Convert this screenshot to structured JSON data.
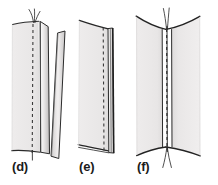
{
  "figure": {
    "type": "line-drawing",
    "background_color": "#ffffff",
    "fabric_fill": "#eceaea",
    "fabric_shade": "#d6d4d4",
    "ink_color": "#1b1b1b",
    "stitch_color": "#3a3a3a",
    "panel_count": 3
  },
  "panels": [
    {
      "id": "d",
      "label": "(d)",
      "caption": "Seam allowance folded open, upper ply lifted away",
      "elements": [
        "main-fabric-panel",
        "folded-seam-allowance",
        "detached-ply",
        "dashed-stitch-line",
        "thread-tails"
      ]
    },
    {
      "id": "e",
      "label": "(e)",
      "caption": "Seam allowance pressed flat to one side",
      "elements": [
        "main-fabric-panel",
        "pressed-seam-allowance",
        "dashed-stitch-line",
        "thread-tails"
      ]
    },
    {
      "id": "f",
      "label": "(f)",
      "caption": "Finished seam, both plies joined with thread through",
      "elements": [
        "left-fabric-panel",
        "right-fabric-panel",
        "dashed-stitch-line",
        "through-thread",
        "thread-tails"
      ]
    }
  ],
  "annotations": {
    "stitch_style": "dashed",
    "stitch_dash_pattern": "3 3"
  }
}
